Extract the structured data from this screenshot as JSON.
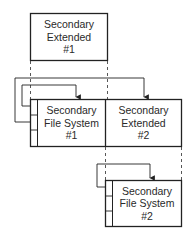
{
  "diagram": {
    "colors": {
      "line": "#222222",
      "dash": "#444444",
      "background": "#ffffff",
      "text": "#2a2a2a"
    },
    "boxes": [
      {
        "id": "sec-ext-1",
        "lines": [
          "Secondary",
          "Extended",
          "#1"
        ]
      },
      {
        "id": "sec-fs-1",
        "lines": [
          "Secondary",
          "File System",
          "#1"
        ]
      },
      {
        "id": "sec-ext-2",
        "lines": [
          "Secondary",
          "Extended",
          "#2"
        ]
      },
      {
        "id": "sec-fs-2",
        "lines": [
          "Secondary",
          "File System",
          "#2"
        ]
      }
    ]
  }
}
